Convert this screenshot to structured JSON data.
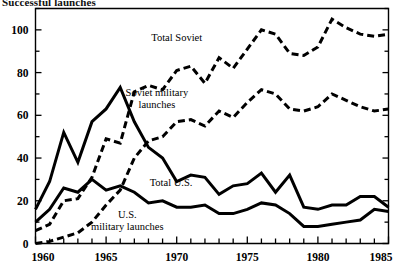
{
  "chart_title": "Successful launches",
  "chart_data": {
    "type": "line",
    "title": "Successful launches",
    "xlabel": "",
    "ylabel": "",
    "xlim": [
      1960,
      1985
    ],
    "ylim": [
      0,
      110
    ],
    "grid": false,
    "legend_position": "inline-annotations",
    "x_ticks": [
      1960,
      1965,
      1970,
      1975,
      1980,
      1985
    ],
    "x_tick_labels": [
      "1960",
      "1965",
      "1970",
      "1975",
      "1980",
      "1985"
    ],
    "x_minor_tick_step": 1,
    "y_ticks": [
      0,
      20,
      40,
      60,
      80,
      100
    ],
    "y_tick_labels": [
      "0",
      "20",
      "40",
      "60",
      "80",
      "100"
    ],
    "y_minor_tick_step": 10,
    "x": [
      1960,
      1961,
      1962,
      1963,
      1964,
      1965,
      1966,
      1967,
      1968,
      1969,
      1970,
      1971,
      1972,
      1973,
      1974,
      1975,
      1976,
      1977,
      1978,
      1979,
      1980,
      1981,
      1982,
      1983,
      1984,
      1985
    ],
    "series": [
      {
        "name": "Total Soviet",
        "label": "Total Soviet",
        "style": "dashed",
        "values": [
          6,
          9,
          20,
          21,
          31,
          49,
          47,
          71,
          74,
          72,
          81,
          83,
          75,
          87,
          82,
          91,
          100,
          98,
          89,
          88,
          92,
          105,
          101,
          98,
          97,
          98
        ],
        "label_x": 1970.0,
        "label_y": 95
      },
      {
        "name": "Soviet military launches",
        "label": "Soviet military launches",
        "style": "dashed",
        "values": [
          0,
          1,
          3,
          5,
          10,
          18,
          25,
          40,
          48,
          50,
          57,
          58,
          55,
          62,
          59,
          66,
          72,
          70,
          63,
          62,
          64,
          70,
          67,
          64,
          62,
          63
        ],
        "label_x": 1968.6,
        "label_y": 69
      },
      {
        "name": "Total U.S.",
        "label": "Total U.S.",
        "style": "solid",
        "values": [
          16,
          29,
          52,
          38,
          57,
          63,
          73,
          57,
          45,
          40,
          29,
          32,
          31,
          23,
          27,
          28,
          33,
          24,
          32,
          17,
          16,
          18,
          18,
          22,
          22,
          17
        ],
        "label_x": 1969.6,
        "label_y": 27
      },
      {
        "name": "U.S. military launches",
        "label": "U.S. military launches",
        "style": "solid",
        "values": [
          10,
          16,
          26,
          24,
          30,
          25,
          27,
          24,
          19,
          20,
          17,
          17,
          18,
          14,
          14,
          16,
          19,
          18,
          14,
          8,
          8,
          9,
          10,
          11,
          16,
          15
        ],
        "label_x": 1966.5,
        "label_y": 12
      }
    ]
  }
}
